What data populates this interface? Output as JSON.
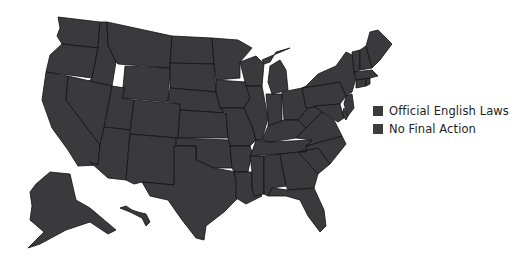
{
  "map": {
    "title": "",
    "subject": "United States — Official English Laws",
    "region_color": "#3a393b",
    "border_color": "#121212",
    "regions": [
      {
        "id": "WA",
        "name": "Washington"
      },
      {
        "id": "OR",
        "name": "Oregon"
      },
      {
        "id": "CA",
        "name": "California"
      },
      {
        "id": "ID",
        "name": "Idaho"
      },
      {
        "id": "NV",
        "name": "Nevada"
      },
      {
        "id": "MT",
        "name": "Montana"
      },
      {
        "id": "WY",
        "name": "Wyoming"
      },
      {
        "id": "UT",
        "name": "Utah"
      },
      {
        "id": "AZ",
        "name": "Arizona"
      },
      {
        "id": "CO",
        "name": "Colorado"
      },
      {
        "id": "NM",
        "name": "New Mexico"
      },
      {
        "id": "ND",
        "name": "North Dakota"
      },
      {
        "id": "SD",
        "name": "South Dakota"
      },
      {
        "id": "NE",
        "name": "Nebraska"
      },
      {
        "id": "KS",
        "name": "Kansas"
      },
      {
        "id": "OK",
        "name": "Oklahoma"
      },
      {
        "id": "TX",
        "name": "Texas"
      },
      {
        "id": "MN",
        "name": "Minnesota"
      },
      {
        "id": "IA",
        "name": "Iowa"
      },
      {
        "id": "MO",
        "name": "Missouri"
      },
      {
        "id": "AR",
        "name": "Arkansas"
      },
      {
        "id": "LA",
        "name": "Louisiana"
      },
      {
        "id": "WI",
        "name": "Wisconsin"
      },
      {
        "id": "IL",
        "name": "Illinois"
      },
      {
        "id": "MI",
        "name": "Michigan"
      },
      {
        "id": "IN",
        "name": "Indiana"
      },
      {
        "id": "OH",
        "name": "Ohio"
      },
      {
        "id": "KY",
        "name": "Kentucky"
      },
      {
        "id": "TN",
        "name": "Tennessee"
      },
      {
        "id": "MS",
        "name": "Mississippi"
      },
      {
        "id": "AL",
        "name": "Alabama"
      },
      {
        "id": "GA",
        "name": "Georgia"
      },
      {
        "id": "FL",
        "name": "Florida"
      },
      {
        "id": "SC",
        "name": "South Carolina"
      },
      {
        "id": "NC",
        "name": "North Carolina"
      },
      {
        "id": "VA",
        "name": "Virginia"
      },
      {
        "id": "WV",
        "name": "West Virginia"
      },
      {
        "id": "PA",
        "name": "Pennsylvania"
      },
      {
        "id": "NY",
        "name": "New York"
      },
      {
        "id": "NJ",
        "name": "New Jersey"
      },
      {
        "id": "DE",
        "name": "Delaware"
      },
      {
        "id": "MD",
        "name": "Maryland"
      },
      {
        "id": "CT",
        "name": "Connecticut"
      },
      {
        "id": "RI",
        "name": "Rhode Island"
      },
      {
        "id": "MA",
        "name": "Massachusetts"
      },
      {
        "id": "VT",
        "name": "Vermont"
      },
      {
        "id": "NH",
        "name": "New Hampshire"
      },
      {
        "id": "ME",
        "name": "Maine"
      },
      {
        "id": "AK",
        "name": "Alaska"
      },
      {
        "id": "HI",
        "name": "Hawaii"
      }
    ]
  },
  "legend": {
    "items": [
      {
        "label": "Official English Laws",
        "color": "#3a393b"
      },
      {
        "label": "No Final Action",
        "color": "#3d3c3e"
      }
    ]
  }
}
